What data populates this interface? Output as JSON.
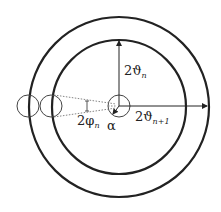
{
  "diagram": {
    "type": "concentric-circles-geometry",
    "labels": {
      "theta_n": {
        "main": "2ϑ",
        "sub": "n"
      },
      "theta_n1": {
        "main": "2ϑ",
        "sub": "n+1"
      },
      "phi_n": {
        "main": "2φ",
        "sub": "n"
      },
      "alpha": "α"
    },
    "colors": {
      "stroke": "#222222",
      "thin": "#444444",
      "dotted": "#777777"
    }
  }
}
